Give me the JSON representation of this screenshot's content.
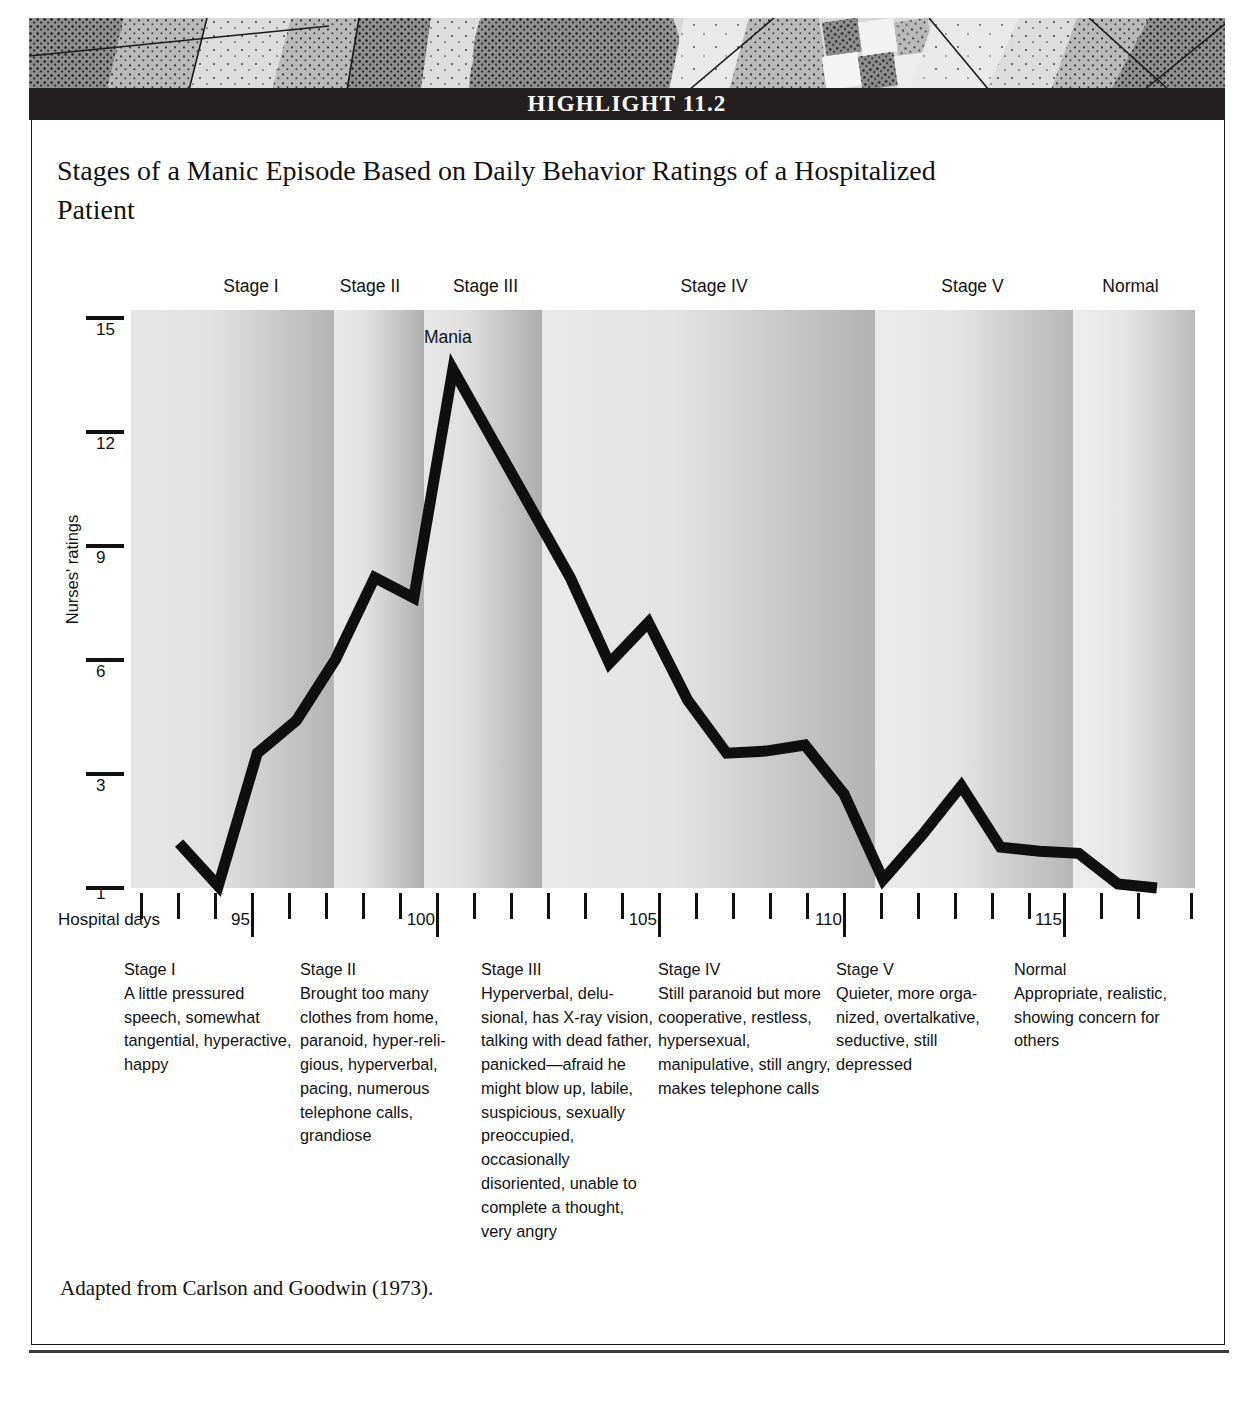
{
  "highlight": {
    "bar_label": "HIGHLIGHT 11.2"
  },
  "figure": {
    "title": "Stages of a Manic Episode Based on Daily Behavior Ratings of a Hospitalized Patient",
    "source_note": "Adapted from Carlson and Goodwin (1973)."
  },
  "chart_data": {
    "type": "line",
    "title": "Stages of a Manic Episode Based on Daily Behavior Ratings of a Hospitalized Patient",
    "xlabel": "Hospital days",
    "ylabel": "Nurses' ratings",
    "xlim": [
      92,
      119
    ],
    "ylim": [
      1,
      15
    ],
    "grid": false,
    "legend": null,
    "y_ticks": [
      15,
      12,
      9,
      6,
      3,
      1
    ],
    "y_tick_labels": [
      "15",
      "12",
      "9",
      "6",
      "3",
      "1"
    ],
    "x_ticks": [
      93,
      94,
      95,
      96,
      97,
      98,
      99,
      100,
      101,
      102,
      103,
      104,
      105,
      106,
      107,
      108,
      109,
      110,
      111,
      112,
      113,
      114,
      115,
      116,
      117,
      118
    ],
    "x_tick_labels_major": [
      "95",
      "100",
      "105",
      "110",
      "115"
    ],
    "x_major_values": [
      95,
      100,
      105,
      110,
      115
    ],
    "annotations": [
      {
        "text": "Mania",
        "x": 101,
        "y": 14.6
      }
    ],
    "series": [
      {
        "name": "Nurses' ratings",
        "x": [
          93,
          94,
          95,
          96,
          97,
          98,
          99,
          100,
          101,
          102,
          103,
          104,
          105,
          106,
          107,
          108,
          109,
          110,
          111,
          112,
          113,
          114,
          115,
          116,
          117,
          118
        ],
        "values": [
          2.1,
          1.05,
          4.3,
          5.1,
          6.6,
          8.6,
          8.1,
          13.7,
          12.0,
          10.3,
          8.6,
          6.5,
          7.5,
          5.6,
          4.3,
          4.35,
          4.5,
          3.3,
          1.2,
          2.3,
          3.5,
          2.0,
          1.9,
          1.85,
          1.1,
          1.0
        ]
      }
    ],
    "stage_bands": [
      {
        "label": "Stage I",
        "x_start": 92.6,
        "x_end": 97.8
      },
      {
        "label": "Stage II",
        "x_start": 97.8,
        "x_end": 100.1
      },
      {
        "label": "Stage III",
        "x_start": 100.1,
        "x_end": 102.8
      },
      {
        "label": "Stage IV",
        "x_start": 102.8,
        "x_end": 111.6
      },
      {
        "label": "Stage V",
        "x_start": 111.6,
        "x_end": 116.6
      },
      {
        "label": "Normal",
        "x_start": 116.6,
        "x_end": 119.6
      }
    ]
  },
  "stage_headers": [
    {
      "label": "Stage I",
      "left": 176,
      "width": 150
    },
    {
      "label": "Stage II",
      "left": 300,
      "width": 140
    },
    {
      "label": "Stage III",
      "left": 413,
      "width": 145
    },
    {
      "label": "Stage IV",
      "left": 639,
      "width": 150
    },
    {
      "label": "Stage V",
      "left": 900,
      "width": 145
    },
    {
      "label": "Normal",
      "left": 1058,
      "width": 145
    }
  ],
  "axis": {
    "y_title": "Nurses' ratings",
    "x_title": "Hospital days",
    "y_ticks": [
      {
        "label": "15",
        "top": 316
      },
      {
        "label": "12",
        "top": 430
      },
      {
        "label": "9",
        "top": 544
      },
      {
        "label": "6",
        "top": 658
      },
      {
        "label": "3",
        "top": 772
      },
      {
        "label": "1",
        "top": 886
      }
    ],
    "x_major_labels": [
      {
        "label": "95",
        "left": 226
      },
      {
        "label": "100",
        "left": 409
      },
      {
        "label": "105",
        "left": 628
      },
      {
        "label": "110",
        "left": 811
      },
      {
        "label": "115",
        "left": 1031
      }
    ]
  },
  "mania_label": "Mania",
  "descriptions": [
    {
      "heading": "Stage I",
      "body": "A little pressured speech, somewhat tangential, hyper­active, happy",
      "left": 124,
      "width": 172
    },
    {
      "heading": "Stage II",
      "body": "Brought too many clothes from home, paranoid, hyper-reli­gious, hyperverbal, pacing, numerous telephone calls, grandiose",
      "left": 300,
      "width": 178
    },
    {
      "heading": "Stage III",
      "body": "Hyperverbal, delu­sional, has X-ray vision, talking with dead father, pan­icked—afraid he might blow up, labile, suspicious, sexually preoccu­pied, occasionally disoriented, unable to complete a thought, very angry",
      "left": 481,
      "width": 172
    },
    {
      "heading": "Stage IV",
      "body": "Still paranoid but more cooperative, restless, hypersexual, manipulative, still angry, makes tele­phone calls",
      "left": 658,
      "width": 178
    },
    {
      "heading": "Stage V",
      "body": "Quieter, more orga­nized, overtalkative, seductive, still depressed",
      "left": 836,
      "width": 178
    },
    {
      "heading": "Normal",
      "body": "Appropriate, realis­tic, showing concern for others",
      "left": 1014,
      "width": 180
    }
  ],
  "colors": {
    "ink": "#111111",
    "bar_background": "#231f20",
    "bar_text": "#ffffff",
    "band_light": "#e4e4e4",
    "band_dark": "#a8a8a8",
    "line": "#0f0f0f"
  }
}
